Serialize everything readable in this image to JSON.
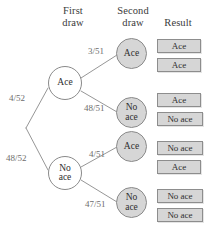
{
  "diagram": {
    "headers": {
      "first_draw_line1": "First",
      "first_draw_line2": "draw",
      "second_draw_line1": "Second",
      "second_draw_line2": "draw",
      "result": "Result"
    },
    "colors": {
      "node_shaded": "#d6d6d6",
      "node_white": "#ffffff",
      "box_fill": "#d6d6d6",
      "line": "#8a8a8a",
      "fraction_text": "#6d6d6d",
      "label_text": "#2e2e2e"
    },
    "first_draw_nodes": [
      {
        "id": "ace",
        "label": "Ace",
        "line1": "Ace",
        "line2": "",
        "fill": "white"
      },
      {
        "id": "no-ace",
        "label": "No ace",
        "line1": "No",
        "line2": "ace",
        "fill": "white"
      }
    ],
    "second_draw_nodes": [
      {
        "id": "ace-ace",
        "label": "Ace",
        "line1": "Ace",
        "line2": "",
        "fill": "shaded"
      },
      {
        "id": "ace-noace",
        "label": "No ace",
        "line1": "No",
        "line2": "ace",
        "fill": "shaded"
      },
      {
        "id": "noace-ace",
        "label": "Ace",
        "line1": "Ace",
        "line2": "",
        "fill": "shaded"
      },
      {
        "id": "noace-noace",
        "label": "No ace",
        "line1": "No",
        "line2": "ace",
        "fill": "shaded"
      }
    ],
    "branch_probabilities": {
      "root_to_ace": "4/52",
      "root_to_no_ace": "48/52",
      "ace_to_ace": "3/51",
      "ace_to_no_ace": "48/51",
      "no_ace_to_ace": "4/51",
      "no_ace_to_no_ace": "47/51"
    },
    "results": [
      {
        "outcome_id": "ace-ace",
        "first": "Ace",
        "second": "Ace"
      },
      {
        "outcome_id": "ace-noace",
        "first": "Ace",
        "second": "No ace"
      },
      {
        "outcome_id": "noace-ace",
        "first": "No ace",
        "second": "Ace"
      },
      {
        "outcome_id": "noace-noace",
        "first": "No ace",
        "second": "No ace"
      }
    ]
  }
}
